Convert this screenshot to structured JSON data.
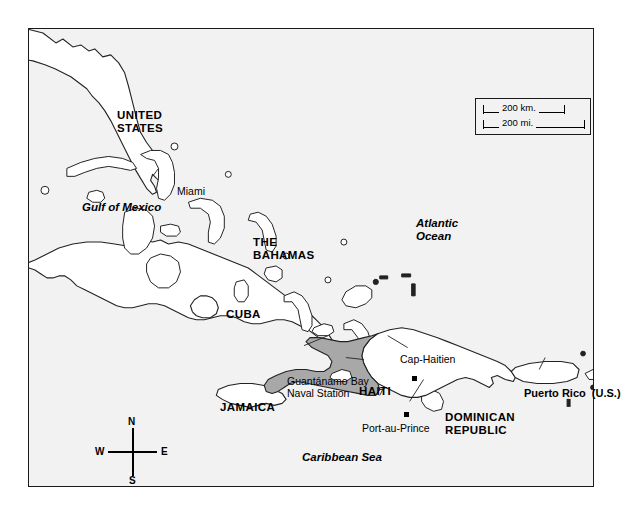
{
  "map": {
    "title": "Caribbean Region Map — Haiti and Hispaniola",
    "background_color": "#f2f2f2",
    "frame_color": "#1a1a1a",
    "land_fill": "#ffffff",
    "highlight_fill": "#a8a8a8",
    "highlight_country": "HAITI"
  },
  "countries": [
    {
      "id": "united-states",
      "label": "UNITED\nSTATES",
      "x": 88,
      "y": 80,
      "style": "country"
    },
    {
      "id": "the-bahamas",
      "label": "THE\nBAHAMAS",
      "x": 224,
      "y": 207,
      "style": "country"
    },
    {
      "id": "cuba",
      "label": "CUBA",
      "x": 197,
      "y": 279,
      "style": "country"
    },
    {
      "id": "jamaica",
      "label": "JAMAICA",
      "x": 191,
      "y": 372,
      "style": "country"
    },
    {
      "id": "haiti",
      "label": "HAITI",
      "x": 330,
      "y": 356,
      "style": "country"
    },
    {
      "id": "dominican-republic",
      "label": "DOMINICAN\nREPUBLIC",
      "x": 416,
      "y": 382,
      "style": "country"
    },
    {
      "id": "puerto-rico",
      "label": "Puerto Rico  (U.S.)",
      "x": 495,
      "y": 358,
      "style": "territory"
    }
  ],
  "water_bodies": [
    {
      "id": "gulf-of-mexico",
      "label": "Gulf of Mexico",
      "x": 53,
      "y": 172
    },
    {
      "id": "atlantic-ocean",
      "label": "Atlantic\nOcean",
      "x": 387,
      "y": 188
    },
    {
      "id": "caribbean-sea",
      "label": "Caribbean Sea",
      "x": 273,
      "y": 422
    }
  ],
  "cities": [
    {
      "id": "miami",
      "label": "Miami",
      "x": 148,
      "y": 157,
      "dot": false
    },
    {
      "id": "cap-haitien",
      "label": "Cap-Haitien",
      "x": 371,
      "y": 325,
      "dot": true,
      "dot_x": 383,
      "dot_y": 347
    },
    {
      "id": "port-au-prince",
      "label": "Port-au-Prince",
      "x": 333,
      "y": 394,
      "dot": true,
      "dot_x": 375,
      "dot_y": 383
    }
  ],
  "places": [
    {
      "id": "guantanamo-bay-naval-station",
      "label": "Guantánamo Bay\nNaval Station",
      "x": 258,
      "y": 347
    }
  ],
  "scale_bar": {
    "id": "scale-bar",
    "km_label": "200 km.",
    "mi_label": "200 mi."
  },
  "compass": {
    "id": "compass-rose",
    "north": "N",
    "south": "S",
    "east": "E",
    "west": "W"
  }
}
